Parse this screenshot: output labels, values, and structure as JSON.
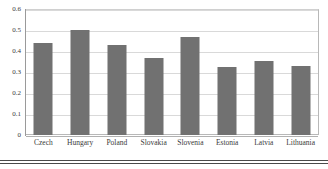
{
  "chart_data": {
    "type": "bar",
    "title": "",
    "xlabel": "",
    "ylabel": "",
    "categories": [
      "Czech",
      "Hungary",
      "Poland",
      "Slovakia",
      "Slovenia",
      "Estonia",
      "Latvia",
      "Lithuania"
    ],
    "values": [
      0.44,
      0.5,
      0.43,
      0.366,
      0.468,
      0.326,
      0.354,
      0.328
    ],
    "ylim": [
      0,
      0.6
    ],
    "ytick_labels": [
      "0",
      "0.1",
      "0.2",
      "0.3",
      "0.4",
      "0.5",
      "0.6"
    ],
    "ytick_values": [
      0,
      0.1,
      0.2,
      0.3,
      0.4,
      0.5,
      0.6
    ],
    "grid": true,
    "legend": false,
    "legend_position": "none",
    "series": [
      {
        "name": "",
        "color": "#717171",
        "values": [
          0.44,
          0.5,
          0.43,
          0.366,
          0.468,
          0.326,
          0.354,
          0.328
        ]
      }
    ]
  },
  "colors": {
    "bar": "#717171",
    "gridline": "#d9d9d9",
    "axis": "#9a9a9a",
    "text": "#3a3a3a",
    "background": "#ffffff",
    "rule": "#4a4a4a"
  }
}
